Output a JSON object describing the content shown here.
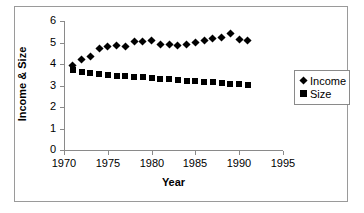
{
  "chart_data": {
    "type": "scatter",
    "title": "",
    "xlabel": "Year",
    "ylabel": "Income & Size",
    "xlim": [
      1970,
      1995
    ],
    "ylim": [
      0,
      6
    ],
    "xticks": [
      1970,
      1975,
      1980,
      1985,
      1990,
      1995
    ],
    "yticks": [
      0,
      1,
      2,
      3,
      4,
      5,
      6
    ],
    "grid": false,
    "legend_position": "right",
    "x": [
      1971,
      1972,
      1973,
      1974,
      1975,
      1976,
      1977,
      1978,
      1979,
      1980,
      1981,
      1982,
      1983,
      1984,
      1985,
      1986,
      1987,
      1988,
      1989,
      1990,
      1991
    ],
    "series": [
      {
        "name": "Income",
        "marker": "diamond",
        "color": "#000000",
        "values": [
          3.95,
          4.2,
          4.35,
          4.7,
          4.8,
          4.85,
          4.8,
          5.05,
          5.05,
          5.1,
          4.9,
          4.9,
          4.85,
          4.9,
          5.0,
          5.1,
          5.2,
          5.25,
          5.42,
          5.15,
          5.1
        ]
      },
      {
        "name": "Size",
        "marker": "square",
        "color": "#000000",
        "values": [
          3.7,
          3.62,
          3.58,
          3.55,
          3.5,
          3.45,
          3.42,
          3.4,
          3.38,
          3.35,
          3.32,
          3.28,
          3.25,
          3.22,
          3.2,
          3.18,
          3.15,
          3.12,
          3.08,
          3.05,
          3.03
        ]
      }
    ]
  },
  "axes": {
    "y_tick_labels": [
      "6",
      "5",
      "4",
      "3",
      "2",
      "1",
      "0"
    ],
    "x_tick_labels": [
      "1970",
      "1975",
      "1980",
      "1985",
      "1990",
      "1995"
    ],
    "x_title": "Year",
    "y_title": "Income & Size"
  },
  "legend": {
    "entries": [
      {
        "label": "Income",
        "marker": "diamond-icon"
      },
      {
        "label": "Size",
        "marker": "square-icon"
      }
    ]
  },
  "colors": {
    "marker": "#000000",
    "axis": "#8a8a8a",
    "frame": "#9a9a9a",
    "background": "#ffffff"
  }
}
